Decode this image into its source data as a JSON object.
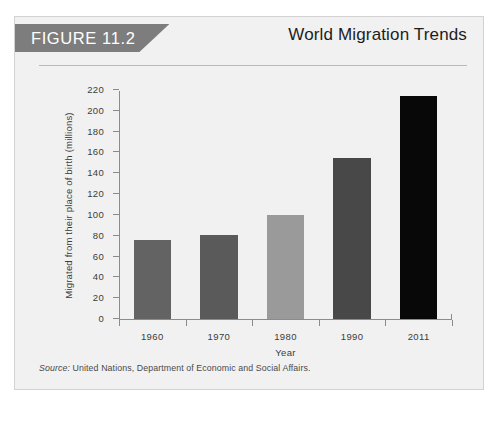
{
  "figure": {
    "banner_label": "FIGURE 11.2",
    "title": "World Migration Trends",
    "source_label": "Source:",
    "source_text": " United Nations, Department of Economic and Social Affairs."
  },
  "colors": {
    "card_background": "#f1f1f1",
    "card_border": "#d2d2d2",
    "banner_background": "#7d7d7d",
    "banner_text": "#ffffff",
    "axis": "#8b8b8b",
    "text": "#3c3c3c",
    "title": "#1d1d1d"
  },
  "chart_data": {
    "type": "bar",
    "title": "World Migration Trends",
    "xlabel": "Year",
    "ylabel": "Migrated from their place of birth (millions)",
    "categories": [
      "1960",
      "1970",
      "1980",
      "1990",
      "2011"
    ],
    "values": [
      76,
      81,
      100,
      155,
      214
    ],
    "bar_colors": [
      "#636363",
      "#5a5a5a",
      "#9a9a9a",
      "#484848",
      "#080808"
    ],
    "ylim": [
      0,
      220
    ],
    "yticks": [
      0,
      20,
      40,
      60,
      80,
      100,
      120,
      140,
      160,
      180,
      200,
      220
    ],
    "ytick_labels": [
      "0",
      "20",
      "40",
      "60",
      "80",
      "100",
      "120",
      "140",
      "160",
      "180",
      "200",
      "220"
    ],
    "grid": false,
    "legend": null
  }
}
